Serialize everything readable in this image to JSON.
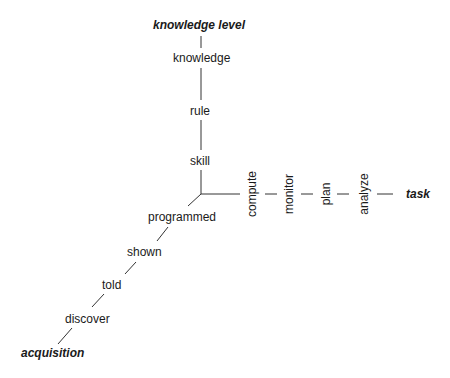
{
  "diagram": {
    "axes": {
      "vertical": {
        "title": "knowledge level",
        "ticks": [
          "knowledge",
          "rule",
          "skill"
        ]
      },
      "horizontal": {
        "title": "task",
        "ticks": [
          "compute",
          "monitor",
          "plan",
          "analyze"
        ]
      },
      "diagonal": {
        "title": "acquisition",
        "ticks": [
          "programmed",
          "shown",
          "told",
          "discover"
        ]
      }
    }
  }
}
